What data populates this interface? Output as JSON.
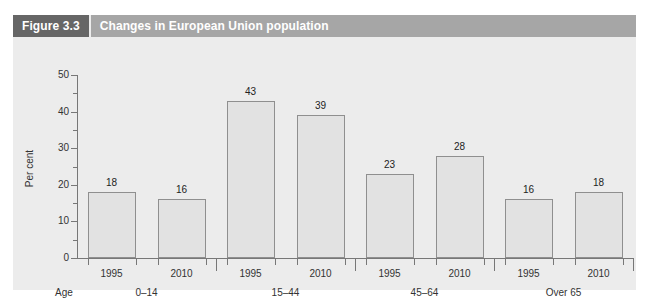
{
  "figure": {
    "number_label": "Figure 3.3",
    "title": "Changes in European Union population",
    "badge_color": "#666666",
    "titlebar_color": "#a6a6a6",
    "background_color": "#ececec"
  },
  "chart_data": {
    "type": "bar",
    "title": "Changes in European Union population",
    "xlabel": "Age",
    "ylabel": "Per cent",
    "ylim": [
      0,
      50
    ],
    "ytick_labels": [
      "0",
      "10",
      "20",
      "30",
      "40",
      "50"
    ],
    "ytick_values": [
      0,
      10,
      20,
      30,
      40,
      50
    ],
    "minor_tick_step": 5,
    "grid": false,
    "legend": "none",
    "bar_fill_color": "#e2e2e2",
    "bar_border_color": "#8f8f8f",
    "groups": [
      {
        "group_label": "0–14",
        "bars": [
          {
            "category": "1995",
            "value": 18,
            "label": "18"
          },
          {
            "category": "2010",
            "value": 16,
            "label": "16"
          }
        ]
      },
      {
        "group_label": "15–44",
        "bars": [
          {
            "category": "1995",
            "value": 43,
            "label": "43"
          },
          {
            "category": "2010",
            "value": 39,
            "label": "39"
          }
        ]
      },
      {
        "group_label": "45–64",
        "bars": [
          {
            "category": "1995",
            "value": 23,
            "label": "23"
          },
          {
            "category": "2010",
            "value": 28,
            "label": "28"
          }
        ]
      },
      {
        "group_label": "Over 65",
        "bars": [
          {
            "category": "1995",
            "value": 16,
            "label": "16"
          },
          {
            "category": "2010",
            "value": 18,
            "label": "18"
          }
        ]
      }
    ],
    "categories": [
      "1995",
      "2010",
      "1995",
      "2010",
      "1995",
      "2010",
      "1995",
      "2010"
    ],
    "values": [
      18,
      16,
      43,
      39,
      23,
      28,
      16,
      18
    ]
  }
}
